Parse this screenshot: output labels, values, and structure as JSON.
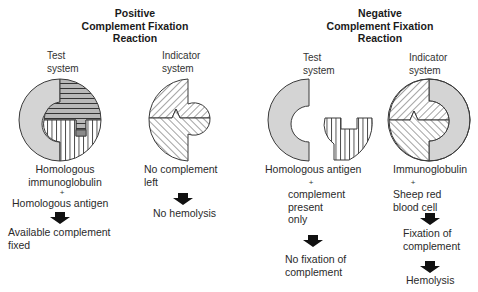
{
  "positive": {
    "title_line1": "Positive",
    "title_line2": "Complement Fixation",
    "title_line3": "Reaction",
    "test_system": {
      "label_line1": "Test",
      "label_line2": "system",
      "caption_line1": "Homologous",
      "caption_line2": "immunoglobulin",
      "plus": "+",
      "caption_line3": "Homologous antigen",
      "result_line1": "Available complement",
      "result_line2": "fixed"
    },
    "indicator_system": {
      "label_line1": "Indicator",
      "label_line2": "system",
      "caption_line1": "No complement",
      "caption_line2": "left",
      "result": "No hemolysis"
    }
  },
  "negative": {
    "title_line1": "Negative",
    "title_line2": "Complement Fixation",
    "title_line3": "Reaction",
    "test_system": {
      "label_line1": "Test",
      "label_line2": "system",
      "caption_line1": "Homologous antigen",
      "plus": "+",
      "caption_line2": "complement",
      "caption_line3": "present",
      "caption_line4": "only",
      "result_line1": "No fixation of",
      "result_line2": "complement"
    },
    "indicator_system": {
      "label_line1": "Indicator",
      "label_line2": "system",
      "caption_line1": "Immunoglobulin",
      "plus": "+",
      "caption_line2": "Sheep red",
      "caption_line3": "blood cell",
      "result1_line1": "Fixation of",
      "result1_line2": "complement",
      "result2": "Hemolysis"
    }
  },
  "colors": {
    "complement_gray": "#d4d4d4",
    "outline": "#3a3a3a",
    "hatch": "#444444",
    "arrow": "#111111"
  },
  "icons": {
    "arrow": "down-arrow-icon"
  }
}
